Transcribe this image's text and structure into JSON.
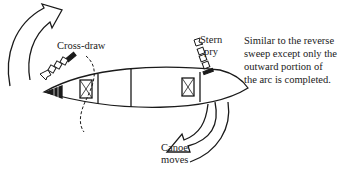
{
  "diagram": {
    "labels": {
      "cross_draw": "Cross-draw",
      "stern_line1": "Stern",
      "stern_line2": "pry",
      "canoe_line1": "Canoe",
      "canoe_line2": "moves"
    },
    "caption": {
      "lines": [
        "Similar to the reverse",
        "sweep except only the",
        "outward portion of",
        "the arc is completed."
      ]
    },
    "elements": [
      {
        "name": "canoe",
        "type": "hull-outline",
        "direction": "bow-left"
      },
      {
        "name": "bow-rotation-arrow",
        "type": "curved-arrow",
        "direction": "clockwise-up-right"
      },
      {
        "name": "stern-rotation-arrow",
        "type": "curved-arrow",
        "direction": "down-left"
      },
      {
        "name": "cross-draw-paddle",
        "type": "paddle-stroke",
        "direction": "outward-left"
      },
      {
        "name": "stern-pry-paddle",
        "type": "paddle-stroke",
        "direction": "outward-up"
      }
    ],
    "colors": {
      "ink": "#1a1a1a",
      "background": "#ffffff"
    }
  }
}
